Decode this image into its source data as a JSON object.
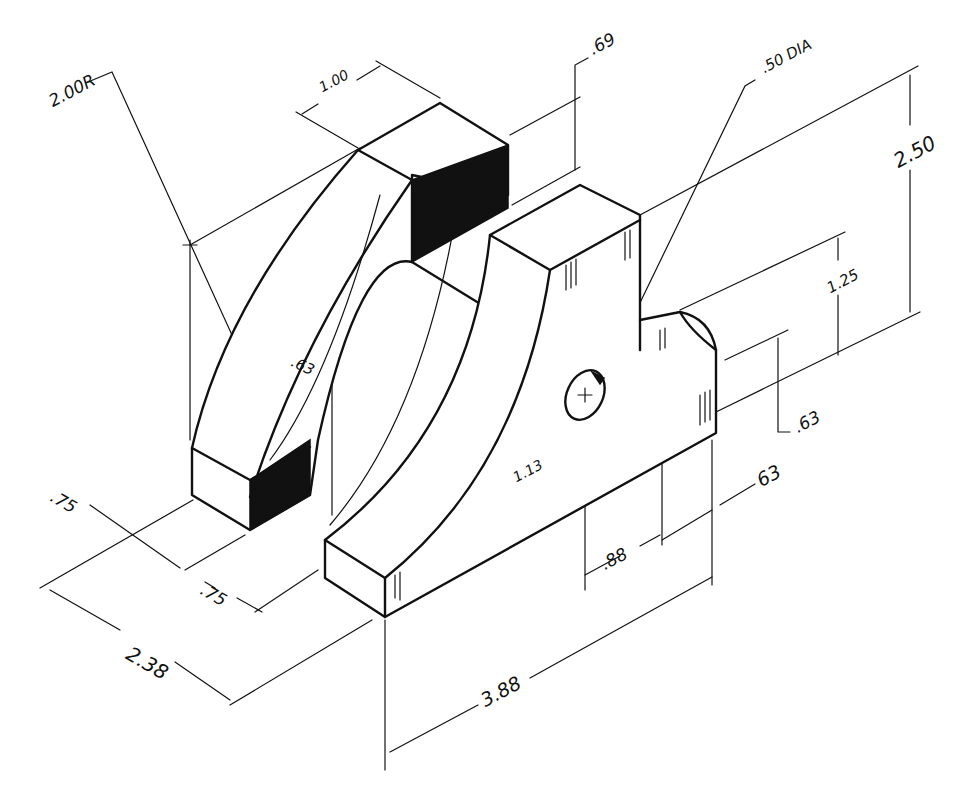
{
  "drawing": {
    "type": "isometric technical drawing",
    "dimensions": {
      "radius": "2.00R",
      "top_depth": "1.00",
      "upper_height": ".69",
      "hole": ".50 DIA",
      "overall_height": "2.50",
      "hole_height": "1.25",
      "lug_height": ".63",
      "slot_depth": ".63",
      "front_left_depth_a": ".75",
      "front_left_depth_b": ".75",
      "overall_depth": "2.38",
      "hole_center_height": "1.13",
      "lug_offset": "63",
      "hole_offset": ".88",
      "overall_length": "3.88"
    }
  }
}
